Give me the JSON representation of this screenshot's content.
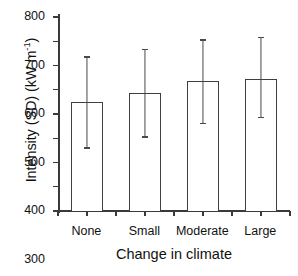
{
  "chart_data": {
    "type": "bar",
    "title": "",
    "subtitle": "",
    "xlabel": "Change in climate",
    "ylabel": "Intensity (SD) (kW m",
    "ylabel_sup": "-1",
    "ylabel_tail": ")",
    "ylabel_full": "Intensity (SD) (kW m-1)",
    "categories": [
      "None",
      "Small",
      "Moderate",
      "Large"
    ],
    "values": [
      450,
      485,
      535,
      545
    ],
    "error_upper": [
      635,
      665,
      705,
      715
    ],
    "error_lower": [
      260,
      305,
      360,
      385
    ],
    "ylim": [
      0,
      800
    ],
    "yticks": [
      0,
      100,
      200,
      300,
      400,
      500,
      600,
      700,
      800
    ],
    "ytick_labels": [
      "0",
      "100",
      "200",
      "300",
      "400",
      "500",
      "600",
      "700",
      "800"
    ],
    "grid": false,
    "legend": "none",
    "bar_facecolor": "#ffffff",
    "bar_edgecolor": "#3f3f3f",
    "errorbar_color": "#4a4a4a",
    "axis_color": "#3a3a3a",
    "background": "#ffffff"
  }
}
